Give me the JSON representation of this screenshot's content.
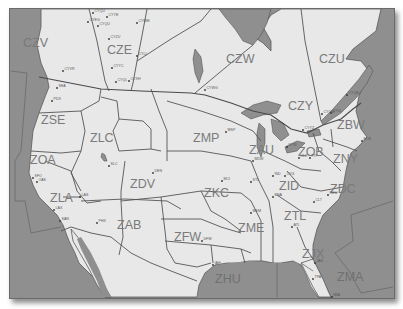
{
  "map": {
    "title": "ARTCC Boundaries - North America",
    "colors": {
      "land": "#e8e8e8",
      "water": "#8f8f8f",
      "border": "#555555",
      "label": "#7a7a7a",
      "frame_shadow": "#737373"
    },
    "regions": [
      {
        "id": "CZV",
        "x": 22,
        "y": 46
      },
      {
        "id": "CZE",
        "x": 106,
        "y": 53
      },
      {
        "id": "CZW",
        "x": 225,
        "y": 62
      },
      {
        "id": "CZU",
        "x": 318,
        "y": 62
      },
      {
        "id": "CZY",
        "x": 287,
        "y": 109
      },
      {
        "id": "ZBW",
        "x": 336,
        "y": 128
      },
      {
        "id": "ZSE",
        "x": 40,
        "y": 123
      },
      {
        "id": "ZLC",
        "x": 89,
        "y": 141
      },
      {
        "id": "ZMP",
        "x": 192,
        "y": 141
      },
      {
        "id": "ZAU",
        "x": 248,
        "y": 153
      },
      {
        "id": "ZOB",
        "x": 297,
        "y": 155
      },
      {
        "id": "ZNY",
        "x": 332,
        "y": 162
      },
      {
        "id": "ZOA",
        "x": 29,
        "y": 163
      },
      {
        "id": "ZDV",
        "x": 129,
        "y": 187
      },
      {
        "id": "ZKC",
        "x": 203,
        "y": 196
      },
      {
        "id": "ZID",
        "x": 278,
        "y": 189
      },
      {
        "id": "ZDC",
        "x": 329,
        "y": 192
      },
      {
        "id": "ZLA",
        "x": 49,
        "y": 201
      },
      {
        "id": "ZAB",
        "x": 116,
        "y": 228
      },
      {
        "id": "ZFW",
        "x": 173,
        "y": 240
      },
      {
        "id": "ZME",
        "x": 237,
        "y": 231
      },
      {
        "id": "ZTL",
        "x": 283,
        "y": 219
      },
      {
        "id": "ZJX",
        "x": 301,
        "y": 257
      },
      {
        "id": "ZHU",
        "x": 214,
        "y": 282
      },
      {
        "id": "ZMA",
        "x": 336,
        "y": 280
      }
    ],
    "cities": [
      {
        "code": "CYEG",
        "x": 87,
        "y": 21
      },
      {
        "code": "CYQU",
        "x": 92,
        "y": 12
      },
      {
        "code": "CYYE",
        "x": 106,
        "y": 16
      },
      {
        "code": "CYQU",
        "x": 97,
        "y": 25
      },
      {
        "code": "CYMM",
        "x": 136,
        "y": 22
      },
      {
        "code": "CYZU",
        "x": 108,
        "y": 38
      },
      {
        "code": "CYLL",
        "x": 136,
        "y": 55
      },
      {
        "code": "CYYC",
        "x": 111,
        "y": 67
      },
      {
        "code": "CYQL",
        "x": 115,
        "y": 81
      },
      {
        "code": "CYXH",
        "x": 128,
        "y": 80
      },
      {
        "code": "CYVR",
        "x": 62,
        "y": 70
      },
      {
        "code": "SEA",
        "x": 56,
        "y": 87
      },
      {
        "code": "PDX",
        "x": 51,
        "y": 100
      },
      {
        "code": "CYWG",
        "x": 204,
        "y": 89
      },
      {
        "code": "MSP",
        "x": 225,
        "y": 131
      },
      {
        "code": "CYYZ",
        "x": 302,
        "y": 129
      },
      {
        "code": "CYUL",
        "x": 330,
        "y": 112
      },
      {
        "code": "CYOW",
        "x": 321,
        "y": 113
      },
      {
        "code": "CYQB",
        "x": 346,
        "y": 94
      },
      {
        "code": "BOS",
        "x": 361,
        "y": 140
      },
      {
        "code": "DTW",
        "x": 286,
        "y": 146
      },
      {
        "code": "CLE",
        "x": 298,
        "y": 157
      },
      {
        "code": "PIT",
        "x": 309,
        "y": 157
      },
      {
        "code": "MDW",
        "x": 252,
        "y": 160
      },
      {
        "code": "IND",
        "x": 272,
        "y": 175
      },
      {
        "code": "CVG",
        "x": 284,
        "y": 175
      },
      {
        "code": "STL",
        "x": 250,
        "y": 181
      },
      {
        "code": "MCI",
        "x": 221,
        "y": 180
      },
      {
        "code": "BNA",
        "x": 272,
        "y": 196
      },
      {
        "code": "MEM",
        "x": 250,
        "y": 212
      },
      {
        "code": "CLT",
        "x": 313,
        "y": 201
      },
      {
        "code": "RDU",
        "x": 327,
        "y": 194
      },
      {
        "code": "ATL",
        "x": 291,
        "y": 226
      },
      {
        "code": "DFW",
        "x": 201,
        "y": 240
      },
      {
        "code": "IAH",
        "x": 212,
        "y": 264
      },
      {
        "code": "JAX",
        "x": 314,
        "y": 262
      },
      {
        "code": "TPA",
        "x": 312,
        "y": 278
      },
      {
        "code": "MIA",
        "x": 331,
        "y": 296
      },
      {
        "code": "SFO",
        "x": 32,
        "y": 177
      },
      {
        "code": "OAK",
        "x": 36,
        "y": 181
      },
      {
        "code": "SLC",
        "x": 108,
        "y": 165
      },
      {
        "code": "DEN",
        "x": 152,
        "y": 172
      },
      {
        "code": "LAS",
        "x": 79,
        "y": 196
      },
      {
        "code": "LAX",
        "x": 53,
        "y": 209
      },
      {
        "code": "SAN",
        "x": 59,
        "y": 220
      },
      {
        "code": "PHX",
        "x": 96,
        "y": 222
      }
    ]
  }
}
